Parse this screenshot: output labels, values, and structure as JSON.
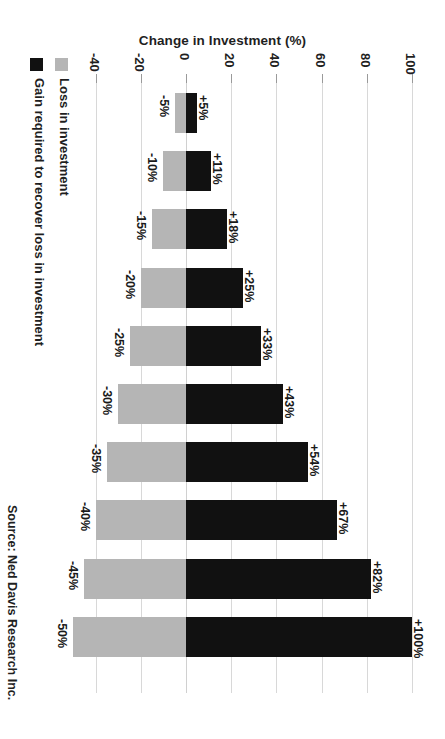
{
  "chart_data": {
    "type": "bar",
    "orientation": "horizontal-rotated",
    "title": "Change in Investment (%)",
    "xlabel": "Change in Investment (%)",
    "ylabel": "",
    "xlim": [
      -50,
      110
    ],
    "grid": true,
    "tick_labels": [
      "-40",
      "-20",
      "0",
      "20",
      "40",
      "60",
      "80",
      "100"
    ],
    "tick_values": [
      -40,
      -20,
      0,
      20,
      40,
      60,
      80,
      100
    ],
    "legend_position": "left",
    "legend": [
      {
        "key": "gain",
        "label": "Gain required to recover loss in investment",
        "color": "#111111"
      },
      {
        "key": "loss",
        "label": "Loss in investment",
        "color": "#b5b5b5"
      }
    ],
    "categories": [
      "-5%",
      "-10%",
      "-15%",
      "-20%",
      "-25%",
      "-30%",
      "-35%",
      "-40%",
      "-45%",
      "-50%"
    ],
    "series": [
      {
        "name": "Loss in investment",
        "color": "#b5b5b5",
        "values": [
          -5,
          -10,
          -15,
          -20,
          -25,
          -30,
          -35,
          -40,
          -45,
          -50
        ],
        "labels": [
          "-5%",
          "-10%",
          "-15%",
          "-20%",
          "-25%",
          "-30%",
          "-35%",
          "-40%",
          "-45%",
          "-50%"
        ]
      },
      {
        "name": "Gain required to recover loss in investment",
        "color": "#111111",
        "values": [
          5,
          11,
          18,
          25,
          33,
          43,
          54,
          67,
          82,
          100
        ],
        "labels": [
          "+5%",
          "+11%",
          "+18%",
          "+25%",
          "+33%",
          "+43%",
          "+54%",
          "+67%",
          "+82%",
          "+100%"
        ]
      }
    ],
    "source": "Source: Ned Davis Research Inc.",
    "colors": {
      "loss": "#b5b5b5",
      "gain": "#111111",
      "grid": "#d8d8d8",
      "background": "#ffffff",
      "text": "#1f1f1f"
    }
  }
}
